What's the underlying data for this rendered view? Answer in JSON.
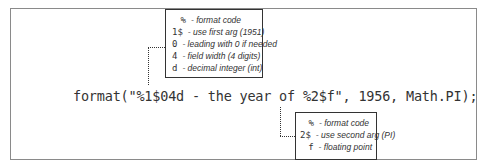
{
  "code_line": "format(\"%1$04d - the year of %2$f\", 1956, Math.PI);",
  "top_callout": {
    "items": [
      {
        "symbol": "%",
        "description": "- format code"
      },
      {
        "symbol": "1$",
        "description": "- use first arg (1951)"
      },
      {
        "symbol": "0",
        "description": "- leading with 0 if needed"
      },
      {
        "symbol": "4",
        "description": "- field width (4 digits)"
      },
      {
        "symbol": "d",
        "description": "- decimal integer (int)"
      }
    ]
  },
  "bottom_callout": {
    "items": [
      {
        "symbol": "%",
        "description": "- format code"
      },
      {
        "symbol": "2$",
        "description": "- use second arg (PI)"
      },
      {
        "symbol": "f",
        "description": "- floating point"
      }
    ]
  }
}
